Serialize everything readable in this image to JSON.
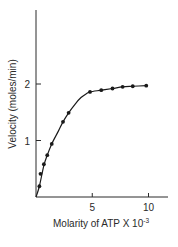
{
  "chart_data": {
    "type": "line",
    "title": "",
    "xlabel": "Molarity of ATP X 10",
    "xlabel_exponent": "-3",
    "ylabel": "Velocity (moles/min)",
    "xlim": [
      0,
      12
    ],
    "ylim": [
      0,
      3.2
    ],
    "xticks": [
      5,
      10
    ],
    "xtick_labels": [
      "5",
      "10"
    ],
    "yticks": [
      1,
      2
    ],
    "ytick_labels": [
      "1",
      "2"
    ],
    "grid": false,
    "legend": null,
    "series": [
      {
        "name": "measured",
        "style": "markers",
        "x": [
          0.3,
          0.4,
          0.7,
          1.0,
          1.4,
          2.4,
          2.9,
          4.8,
          5.8,
          6.8,
          7.7,
          8.6,
          9.8
        ],
        "y": [
          0.19,
          0.41,
          0.58,
          0.74,
          0.94,
          1.33,
          1.49,
          1.86,
          1.89,
          1.92,
          1.95,
          1.96,
          1.97
        ]
      },
      {
        "name": "fit curve",
        "style": "smooth-line",
        "x": [
          0,
          0.3,
          0.7,
          1.0,
          1.4,
          2.0,
          2.4,
          2.9,
          3.5,
          4.0,
          4.5,
          4.8,
          5.8,
          6.8,
          7.7,
          8.6,
          9.8
        ],
        "y": [
          0,
          0.19,
          0.56,
          0.74,
          0.94,
          1.17,
          1.33,
          1.49,
          1.65,
          1.76,
          1.83,
          1.86,
          1.89,
          1.92,
          1.95,
          1.96,
          1.97
        ]
      }
    ],
    "colors": {
      "axis": "#2a2a2a",
      "line": "#1a1a1a",
      "marker": "#1a1a1a",
      "background": "#ffffff"
    }
  }
}
